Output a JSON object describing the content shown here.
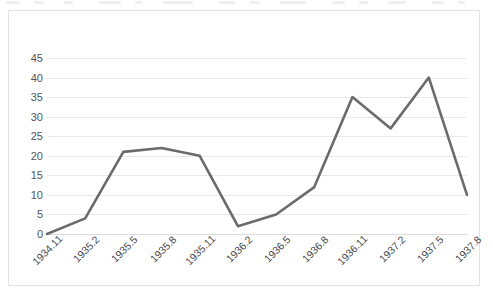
{
  "figure": {
    "border_color": "#e2e2e4",
    "background": "#ffffff"
  },
  "chart_data": {
    "type": "line",
    "title": "",
    "subtitle": "",
    "xlabel": "",
    "ylabel": "",
    "categories": [
      "1934.11",
      "1935.2",
      "1935.5",
      "1935.8",
      "1935.11",
      "1936.2",
      "1936.5",
      "1936.8",
      "1936.11",
      "1937.2",
      "1937.5",
      "1937.8"
    ],
    "values": [
      0,
      4,
      21,
      22,
      20,
      2,
      5,
      12,
      35,
      27,
      40,
      10
    ],
    "series": [
      {
        "name": "",
        "values": [
          0,
          4,
          21,
          22,
          20,
          2,
          5,
          12,
          35,
          27,
          40,
          10
        ],
        "color": "#6b6b6b",
        "line_width": 2.6,
        "markers": false
      }
    ],
    "ylim": [
      0,
      45
    ],
    "y_ticks": [
      0,
      5,
      10,
      15,
      20,
      25,
      30,
      35,
      40,
      45
    ],
    "y_tick_labels": [
      "0",
      "5",
      "10",
      "15",
      "20",
      "25",
      "30",
      "35",
      "40",
      "45"
    ],
    "x_tick_labels": [
      "1934.11",
      "1935.2",
      "1935.5",
      "1935.8",
      "1935.11",
      "1936.2",
      "1936.5",
      "1936.8",
      "1936.11",
      "1937.2",
      "1937.5",
      "1937.8"
    ],
    "x_tick_rotation": -45,
    "grid": {
      "horizontal": true,
      "vertical": false,
      "color": "#e8e8ea"
    },
    "legend": {
      "visible": false,
      "position": "none",
      "entries": []
    },
    "axis_line_color": "#dcdcde",
    "tick_label_color": "#555558"
  }
}
